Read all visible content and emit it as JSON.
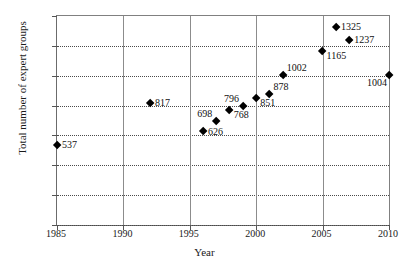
{
  "chart_data": {
    "type": "scatter",
    "title": "",
    "xlabel": "Year",
    "ylabel": "Total number of expert groups",
    "xlim": [
      1985,
      2010
    ],
    "ylim": [
      0,
      1400
    ],
    "xticks": [
      1985,
      1990,
      1995,
      2000,
      2005,
      2010
    ],
    "yticks": [
      0,
      200,
      400,
      600,
      800,
      1000,
      1200,
      1400
    ],
    "grid": "horizontal dotted, vertical solid",
    "legend": "none",
    "marker": "black diamond",
    "x": [
      1985,
      1992,
      1996,
      1997,
      1998,
      1999,
      2000,
      2001,
      2002,
      2005,
      2006,
      2007,
      2010
    ],
    "points": [
      {
        "x": 1985,
        "y": 537,
        "label": "537",
        "pos": "right"
      },
      {
        "x": 1992,
        "y": 817,
        "label": "817",
        "pos": "right"
      },
      {
        "x": 1996,
        "y": 626,
        "label": "626",
        "pos": "right"
      },
      {
        "x": 1997,
        "y": 698,
        "label": "698",
        "pos": "upper-left"
      },
      {
        "x": 1998,
        "y": 768,
        "label": "768",
        "pos": "right-below"
      },
      {
        "x": 1999,
        "y": 796,
        "label": "796",
        "pos": "upper-left"
      },
      {
        "x": 2000,
        "y": 851,
        "label": "851",
        "pos": "right-below"
      },
      {
        "x": 2001,
        "y": 878,
        "label": "878",
        "pos": "upper-right"
      },
      {
        "x": 2002,
        "y": 1002,
        "label": "1002",
        "pos": "upper-right"
      },
      {
        "x": 2005,
        "y": 1165,
        "label": "1165",
        "pos": "right-below"
      },
      {
        "x": 2006,
        "y": 1325,
        "label": "1325",
        "pos": "right"
      },
      {
        "x": 2007,
        "y": 1237,
        "label": "1237",
        "pos": "right"
      },
      {
        "x": 2010,
        "y": 1004,
        "label": "1004",
        "pos": "down-left"
      }
    ],
    "values": [
      537,
      817,
      626,
      698,
      768,
      796,
      851,
      878,
      1002,
      1165,
      1325,
      1237,
      1004
    ]
  }
}
